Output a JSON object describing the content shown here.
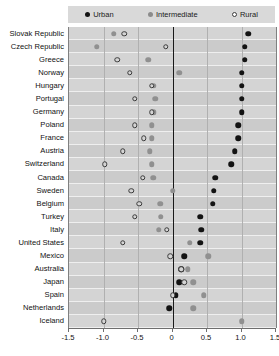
{
  "chart_data": {
    "type": "scatter",
    "title": "",
    "subtitle": "",
    "xlabel": "",
    "ylabel": "",
    "xlim": [
      -1.5,
      1.5
    ],
    "xticks": [
      -1.5,
      -1.0,
      -0.5,
      0,
      0.5,
      1.0,
      1.5
    ],
    "xticklabels": [
      "-1.5",
      "-1.0",
      "-0.5",
      "0",
      "0.5",
      "1.0",
      "1.5"
    ],
    "grid": true,
    "legend_position": "top",
    "orientation": "horizontal",
    "categories": [
      "Slovak Republic",
      "Czech Republic",
      "Greece",
      "Norway",
      "Hungary",
      "Portugal",
      "Germany",
      "Poland",
      "France",
      "Austria",
      "Switzerland",
      "Canada",
      "Sweden",
      "Belgium",
      "Turkey",
      "Italy",
      "United States",
      "Mexico",
      "Australia",
      "Japan",
      "Spain",
      "Netherlands",
      "Iceland"
    ],
    "series": [
      {
        "name": "Urban",
        "marker": "filled-circle",
        "color": "#131313",
        "values": [
          1.1,
          1.05,
          1.05,
          1.0,
          1.0,
          1.0,
          1.0,
          0.95,
          0.95,
          0.9,
          0.85,
          0.62,
          0.6,
          0.58,
          0.4,
          0.42,
          0.4,
          0.17,
          0.13,
          0.1,
          0.05,
          -0.05,
          null
        ]
      },
      {
        "name": "Intermediate",
        "marker": "filled-circle-gray",
        "color": "#909090",
        "values": [
          -0.85,
          -1.1,
          -0.35,
          0.1,
          -0.27,
          -0.25,
          -0.27,
          -0.3,
          -0.3,
          -0.33,
          -0.3,
          -0.28,
          0.0,
          -0.18,
          -0.17,
          -0.2,
          0.25,
          0.52,
          0.22,
          0.3,
          0.45,
          0.3,
          1.0
        ]
      },
      {
        "name": "Rural",
        "marker": "open-circle",
        "color": "#3a3a3a",
        "values": [
          -0.7,
          -0.1,
          -0.8,
          -0.62,
          -0.3,
          -0.55,
          -0.3,
          -0.55,
          -0.42,
          -0.72,
          -0.98,
          -0.43,
          -0.6,
          -0.48,
          -0.55,
          -0.08,
          -0.72,
          -0.03,
          0.13,
          0.17,
          0.0,
          null,
          -1.0
        ]
      }
    ]
  },
  "legend": {
    "items": [
      {
        "label": "Urban",
        "marker": "urban-marker-icon"
      },
      {
        "label": "Intermediate",
        "marker": "intermediate-marker-icon"
      },
      {
        "label": "Rural",
        "marker": "rural-marker-icon"
      }
    ]
  },
  "colors": {
    "urban": "#131313",
    "intermediate": "#909090",
    "rural_stroke": "#3a3a3a",
    "plot_background": "#d4d4d4",
    "band_alt": "#cbcbcb",
    "legend_background": "#d9d9d9",
    "zero_line": "#1a1a1a",
    "grid_line": "#b0b0b0"
  }
}
